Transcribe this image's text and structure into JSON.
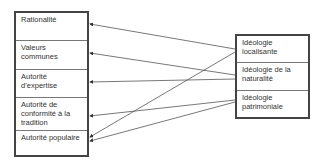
{
  "left_box": {
    "items": [
      {
        "label": "Rationalité"
      },
      {
        "label": "Valeurs communes"
      },
      {
        "label": "Autorité d’expertise"
      },
      {
        "label": "Autorité de conformité à la tradition"
      },
      {
        "label": "Autorité populaire"
      }
    ]
  },
  "right_box": {
    "items": [
      {
        "label": "Idéologie localisante"
      },
      {
        "label": "Idéologie de la naturalité"
      },
      {
        "label": "Idéologie patrimoniale"
      }
    ]
  },
  "connections": [
    {
      "from": "Idéologie localisante",
      "to": "Rationalité"
    },
    {
      "from": "Idéologie localisante",
      "to": "Autorité populaire"
    },
    {
      "from": "Idéologie de la naturalité",
      "to": "Valeurs communes"
    },
    {
      "from": "Idéologie de la naturalité",
      "to": "Autorité d’expertise"
    },
    {
      "from": "Idéologie patrimoniale",
      "to": "Autorité de conformité à la tradition"
    },
    {
      "from": "Idéologie patrimoniale",
      "to": "Autorité populaire"
    }
  ],
  "colors": {
    "line": "#555555",
    "border": "#444444"
  }
}
